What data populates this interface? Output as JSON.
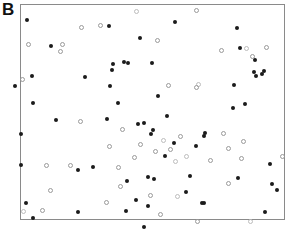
{
  "figure": {
    "panel_label": "B",
    "width": 290,
    "height": 232,
    "background_color": "#ffffff"
  },
  "frame": {
    "x": 20,
    "y": 4,
    "width": 265,
    "height": 216,
    "border_color": "#8a8a8a",
    "border_width": 1
  },
  "legend": {
    "present": false,
    "series_names": [
      "Filled markers",
      "Open markers"
    ]
  },
  "axes": {
    "tick_labels_x": [],
    "tick_labels_y": [],
    "xlabel": "",
    "ylabel": "",
    "grid": false
  },
  "chart_data": {
    "type": "scatter",
    "title": "",
    "subtitle": "",
    "xlabel": "",
    "ylabel": "",
    "xlim": [
      20,
      285
    ],
    "ylim": [
      4,
      220
    ],
    "grid": false,
    "legend_position": "none",
    "annotations": [
      {
        "text": "B",
        "x": 4,
        "y": 4,
        "role": "panel-label"
      }
    ],
    "marker_styles": {
      "filled": {
        "shape": "circle",
        "fill": "#1b1b1b",
        "size": 4
      },
      "open": {
        "shape": "circle",
        "fill": "none",
        "stroke": "#9a9a9a",
        "size": 5
      },
      "open_light": {
        "shape": "circle",
        "fill": "none",
        "stroke": "#bdbdbd",
        "size": 5
      },
      "square_open": {
        "shape": "square",
        "fill": "none",
        "stroke": "#9a9a9a",
        "size": 4
      }
    },
    "series": [
      {
        "name": "Filled markers",
        "style": "filled",
        "count": 62,
        "points": [
          [
            27,
            20
          ],
          [
            51,
            46
          ],
          [
            109,
            26
          ],
          [
            140,
            38
          ],
          [
            113,
            64
          ],
          [
            124,
            62
          ],
          [
            128,
            63
          ],
          [
            152,
            63
          ],
          [
            175,
            22
          ],
          [
            237,
            28
          ],
          [
            240,
            48
          ],
          [
            255,
            60
          ],
          [
            264,
            71
          ],
          [
            256,
            76
          ],
          [
            32,
            76
          ],
          [
            85,
            77
          ],
          [
            112,
            70
          ],
          [
            110,
            86
          ],
          [
            33,
            103
          ],
          [
            56,
            120
          ],
          [
            118,
            103
          ],
          [
            15,
            86
          ],
          [
            234,
            85
          ],
          [
            254,
            72
          ],
          [
            262,
            74
          ],
          [
            245,
            104
          ],
          [
            233,
            108
          ],
          [
            205,
            133
          ],
          [
            138,
            124
          ],
          [
            144,
            123
          ],
          [
            153,
            130
          ],
          [
            151,
            134
          ],
          [
            204,
            136
          ],
          [
            196,
            146
          ],
          [
            78,
            170
          ],
          [
            21,
            165
          ],
          [
            26,
            203
          ],
          [
            33,
            218
          ],
          [
            78,
            212
          ],
          [
            148,
            177
          ],
          [
            154,
            179
          ],
          [
            127,
            181
          ],
          [
            238,
            178
          ],
          [
            272,
            184
          ],
          [
            277,
            190
          ],
          [
            204,
            203
          ],
          [
            265,
            212
          ],
          [
            270,
            164
          ],
          [
            190,
            176
          ],
          [
            136,
            200
          ],
          [
            148,
            206
          ],
          [
            126,
            211
          ],
          [
            202,
            203
          ],
          [
            165,
            156
          ],
          [
            21,
            134
          ],
          [
            93,
            167
          ],
          [
            107,
            119
          ],
          [
            158,
            96
          ],
          [
            167,
            116
          ],
          [
            174,
            143
          ],
          [
            186,
            192
          ],
          [
            144,
            227
          ]
        ]
      },
      {
        "name": "Open markers",
        "style": "open",
        "count": 47,
        "points": [
          [
            28,
            44
          ],
          [
            81,
            27
          ],
          [
            62,
            44
          ],
          [
            60,
            51
          ],
          [
            136,
            11
          ],
          [
            100,
            25
          ],
          [
            157,
            40
          ],
          [
            196,
            10
          ],
          [
            221,
            50
          ],
          [
            246,
            48
          ],
          [
            266,
            47
          ],
          [
            252,
            56
          ],
          [
            22,
            79
          ],
          [
            80,
            121
          ],
          [
            198,
            84
          ],
          [
            223,
            133
          ],
          [
            46,
            165
          ],
          [
            70,
            165
          ],
          [
            50,
            190
          ],
          [
            23,
            211
          ],
          [
            42,
            210
          ],
          [
            106,
            202
          ],
          [
            228,
            183
          ],
          [
            282,
            156
          ],
          [
            250,
            221
          ],
          [
            168,
            85
          ],
          [
            196,
            87
          ],
          [
            140,
            144
          ],
          [
            155,
            151
          ],
          [
            163,
            140
          ],
          [
            180,
            136
          ],
          [
            170,
            149
          ],
          [
            134,
            157
          ],
          [
            118,
            167
          ],
          [
            175,
            161
          ],
          [
            210,
            160
          ],
          [
            228,
            148
          ],
          [
            241,
            158
          ],
          [
            150,
            195
          ],
          [
            177,
            196
          ],
          [
            160,
            214
          ],
          [
            197,
            221
          ],
          [
            109,
            146
          ],
          [
            122,
            129
          ],
          [
            186,
            156
          ],
          [
            243,
            141
          ],
          [
            120,
            186
          ]
        ]
      }
    ]
  }
}
